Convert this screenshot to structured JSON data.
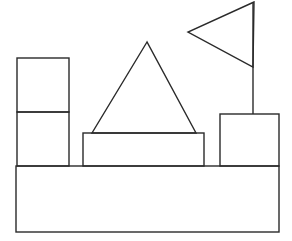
{
  "diagram": {
    "stroke_color": "#2a2a2a",
    "background": "#ffffff",
    "shapes": [
      {
        "id": "base",
        "type": "rect",
        "x": 16,
        "y": 166,
        "w": 263,
        "h": 66
      },
      {
        "id": "left-box-top",
        "type": "rect",
        "x": 17,
        "y": 58,
        "w": 52,
        "h": 54
      },
      {
        "id": "left-box-bottom",
        "type": "rect",
        "x": 17,
        "y": 112,
        "w": 52,
        "h": 54
      },
      {
        "id": "middle-rect",
        "type": "rect",
        "x": 83,
        "y": 133,
        "w": 121,
        "h": 33
      },
      {
        "id": "middle-triangle",
        "type": "polygon",
        "points": "147,42 92,133 196,133"
      },
      {
        "id": "right-box",
        "type": "rect",
        "x": 220,
        "y": 114,
        "w": 59,
        "h": 52
      },
      {
        "id": "flag-pole",
        "type": "line",
        "x1": 253,
        "y1": 2,
        "x2": 253,
        "y2": 114
      },
      {
        "id": "flag",
        "type": "polygon",
        "points": "254,2 188,32 253,67"
      }
    ]
  }
}
